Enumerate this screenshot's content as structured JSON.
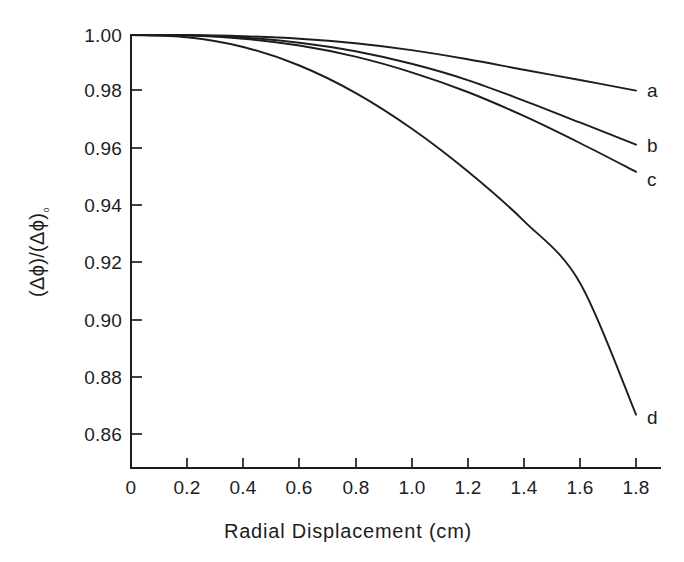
{
  "figure": {
    "background_color": "#ffffff",
    "ink_color": "#1d1d1d"
  },
  "chart_data": {
    "type": "line",
    "title": "",
    "subtitle": "",
    "xlabel": "Radial Displacement (cm)",
    "ylabel": "(Δϕ)/(Δϕ)₀",
    "ylabel_parts": {
      "numerator": "(Δϕ)",
      "slash": "/",
      "denominator": "(Δϕ)",
      "subscript": "₀"
    },
    "xlim": [
      0,
      1.9
    ],
    "ylim": [
      0.85,
      1.0
    ],
    "grid": false,
    "legend_position": "inline-right-end-labels",
    "xticks": [
      0,
      0.2,
      0.4,
      0.6,
      0.8,
      1.0,
      1.2,
      1.4,
      1.6,
      1.8
    ],
    "xtick_labels": [
      "0",
      "0.2",
      "0.4",
      "0.6",
      "0.8",
      "1.0",
      "1.2",
      "1.4",
      "1.6",
      "1.8"
    ],
    "yticks": [
      0.86,
      0.88,
      0.9,
      0.92,
      0.94,
      0.96,
      0.98,
      1.0
    ],
    "ytick_labels": [
      "0.86",
      "0.88",
      "0.90",
      "0.92",
      "0.94",
      "0.96",
      "0.98",
      "1.00"
    ],
    "x": [
      0,
      0.2,
      0.4,
      0.6,
      0.8,
      1.0,
      1.2,
      1.4,
      1.6,
      1.8
    ],
    "series": [
      {
        "name": "a",
        "label": "a",
        "values": [
          1.0,
          1.0,
          0.9996,
          0.9987,
          0.9971,
          0.9947,
          0.9915,
          0.9878,
          0.9842,
          0.9805
        ]
      },
      {
        "name": "b",
        "label": "b",
        "values": [
          1.0,
          0.9999,
          0.9991,
          0.9973,
          0.9943,
          0.9899,
          0.9842,
          0.977,
          0.9693,
          0.9615
        ]
      },
      {
        "name": "c",
        "label": "c",
        "values": [
          1.0,
          0.9998,
          0.9987,
          0.9963,
          0.9924,
          0.9869,
          0.98,
          0.9716,
          0.9621,
          0.952
        ]
      },
      {
        "name": "d",
        "label": "d",
        "values": [
          1.0,
          0.9992,
          0.9958,
          0.9893,
          0.9797,
          0.9672,
          0.9522,
          0.9348,
          0.9131,
          0.8668
        ]
      }
    ],
    "annotations": [
      {
        "text": "a",
        "x": 1.8,
        "y": 0.9805
      },
      {
        "text": "b",
        "x": 1.8,
        "y": 0.9615
      },
      {
        "text": "c",
        "x": 1.8,
        "y": 0.952
      },
      {
        "text": "d",
        "x": 1.8,
        "y": 0.8668
      }
    ]
  }
}
